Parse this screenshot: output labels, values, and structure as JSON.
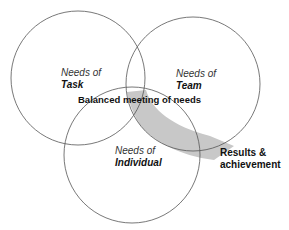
{
  "diagram": {
    "type": "venn",
    "circles": [
      {
        "id": "task",
        "line1": "Needs of",
        "line2": "Task"
      },
      {
        "id": "team",
        "line1": "Needs of",
        "line2": "Team"
      },
      {
        "id": "individual",
        "line1": "Needs of",
        "line2": "Individual"
      }
    ],
    "center_label": "Balanced meeting of needs",
    "outcome": {
      "line1": "Results &",
      "line2": "achievement"
    },
    "colors": {
      "stroke": "#555555",
      "arrow_fill": "#c8c8c8",
      "background": "#ffffff"
    }
  }
}
